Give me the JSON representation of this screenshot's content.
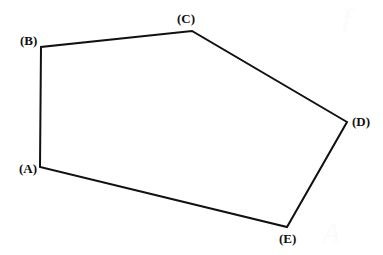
{
  "figure": {
    "name": "labeled-pentagon",
    "width": 383,
    "height": 255,
    "background_color": "#ffffff",
    "stroke_color": "#111111",
    "stroke_width": 2,
    "fill": "none",
    "label_color": "#111111",
    "vertices": [
      {
        "id": "A",
        "label": "(A)",
        "x": 40,
        "y": 167,
        "label_x": 19,
        "label_y": 161,
        "label_anchor": "left-below"
      },
      {
        "id": "B",
        "label": "(B)",
        "x": 41,
        "y": 47,
        "label_x": 20,
        "label_y": 33,
        "label_anchor": "left-above"
      },
      {
        "id": "C",
        "label": "(C)",
        "x": 192,
        "y": 31,
        "label_x": 177,
        "label_y": 11,
        "label_anchor": "above"
      },
      {
        "id": "D",
        "label": "(D)",
        "x": 347,
        "y": 122,
        "label_x": 352,
        "label_y": 114,
        "label_anchor": "right"
      },
      {
        "id": "E",
        "label": "(E)",
        "x": 287,
        "y": 227,
        "label_x": 279,
        "label_y": 231,
        "label_anchor": "below"
      }
    ],
    "edges": [
      {
        "from": "A",
        "to": "B"
      },
      {
        "from": "B",
        "to": "C"
      },
      {
        "from": "C",
        "to": "D"
      },
      {
        "from": "D",
        "to": "E"
      },
      {
        "from": "E",
        "to": "A"
      }
    ],
    "path_d": "M 40 167 L 41 47 L 192 31 L 347 122 L 287 227 Z",
    "watermarks": [
      {
        "glyph": "ƒ",
        "x": 347,
        "y": 8
      },
      {
        "glyph": "A",
        "x": 330,
        "y": 228
      }
    ]
  }
}
